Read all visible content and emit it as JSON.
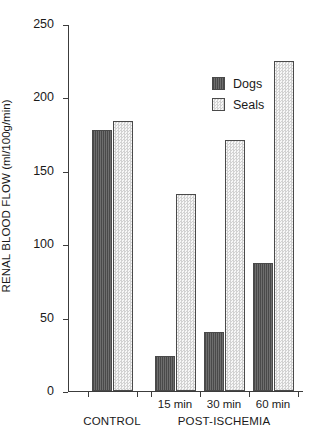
{
  "chart_data": {
    "type": "bar",
    "title": "",
    "xlabel": "",
    "ylabel": "RENAL BLOOD FLOW  (ml/100g/min)",
    "ylabel_main": "RENAL BLOOD FLOW",
    "ylabel_unit": "(ml/100g/min)",
    "ylim": [
      0,
      250
    ],
    "ytick_values": [
      0,
      50,
      100,
      150,
      200,
      250
    ],
    "ytick_labels": [
      "0",
      "50",
      "100",
      "150",
      "200",
      "250"
    ],
    "grid": false,
    "legend_position": "upper center",
    "categories": [
      "CONTROL",
      "15 min",
      "30 min",
      "60 min"
    ],
    "group_labels": [
      "CONTROL",
      "POST-ISCHEMIA"
    ],
    "xtick_labels": [
      "",
      "15 min",
      "30 min",
      "60 min"
    ],
    "series": [
      {
        "name": "Dogs",
        "values": [
          178,
          24,
          40,
          87
        ]
      },
      {
        "name": "Seals",
        "values": [
          184,
          134,
          171,
          225
        ]
      }
    ],
    "legend": [
      {
        "label": "Dogs",
        "swatch": "dark-gray-hatched"
      },
      {
        "label": "Seals",
        "swatch": "light-stippled"
      }
    ],
    "colors": {
      "dogs": "#5e5e5e",
      "seals": "#ececec",
      "axis": "#3c3c3c",
      "text": "#1a1a1a",
      "background": "#ffffff"
    }
  }
}
